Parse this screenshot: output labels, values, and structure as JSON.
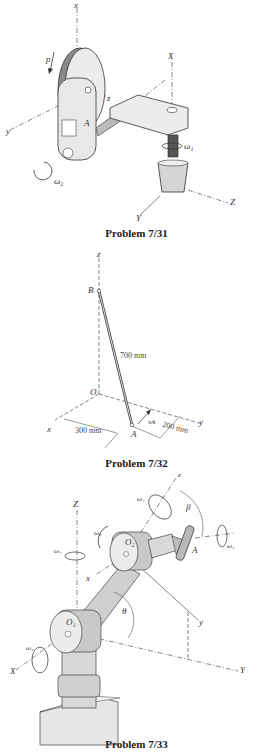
{
  "figures": [
    {
      "caption": "Problem 7/31",
      "labels": {
        "x": "x",
        "y": "y",
        "z": "z",
        "X": "X",
        "Y": "Y",
        "Z": "Z",
        "p": "p",
        "A": "A",
        "omega1": "ω₁",
        "omega2": "ω₂"
      }
    },
    {
      "caption": "Problem 7/32",
      "labels": {
        "z": "z",
        "B": "B",
        "O": "O",
        "x": "x",
        "y": "y",
        "A": "A",
        "vA": "vA",
        "length": "700 mm",
        "dim_x": "300 mm",
        "dim_y": "200 mm"
      }
    },
    {
      "caption": "Problem 7/33",
      "labels": {
        "Z": "Z",
        "X": "X",
        "Y": "Y",
        "x": "x",
        "y": "y",
        "z": "z",
        "O1": "O₁",
        "O2": "O₂",
        "A": "A",
        "beta": "β",
        "theta": "θ",
        "omega1": "ω₁",
        "omega2": "ω₂",
        "omega3": "ω₃",
        "omega4": "ω₄",
        "omega5": "ω₅"
      }
    }
  ]
}
